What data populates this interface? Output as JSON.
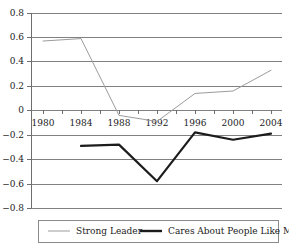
{
  "chart_data": {
    "type": "line",
    "title": "",
    "xlabel": "",
    "ylabel": "",
    "x": [
      1980,
      1984,
      1988,
      1992,
      1996,
      2000,
      2004
    ],
    "xlim": [
      1979,
      2005
    ],
    "ylim": [
      -0.8,
      0.8
    ],
    "grid": true,
    "legend_position": "bottom",
    "xticks": [
      "1980",
      "1984",
      "1988",
      "1992",
      "1996",
      "2000",
      "2004"
    ],
    "yticks": [
      "0.8",
      "0.6",
      "0.4",
      "0.2",
      "0",
      "−0.2",
      "−0.4",
      "−0.6",
      "−0.8"
    ],
    "ytick_values": [
      0.8,
      0.6,
      0.4,
      0.2,
      0,
      -0.2,
      -0.4,
      -0.6,
      -0.8
    ],
    "series": [
      {
        "name": "Strong Leader",
        "color": "#9b9b9b",
        "x": [
          1980,
          1984,
          1988,
          1992,
          1996,
          2000,
          2004
        ],
        "values": [
          0.57,
          0.59,
          -0.04,
          -0.09,
          0.14,
          0.16,
          0.33
        ]
      },
      {
        "name": "Cares About People Like Me",
        "color": "#1c1c1c",
        "x": [
          1984,
          1988,
          1992,
          1996,
          2000,
          2004
        ],
        "values": [
          -0.29,
          -0.28,
          -0.58,
          -0.18,
          -0.24,
          -0.19
        ]
      }
    ]
  },
  "legend": {
    "items": [
      {
        "label": "Strong Leader",
        "swatch": "thin-gray-line"
      },
      {
        "label": "Cares About People Like Me",
        "swatch": "thick-black-line"
      }
    ]
  },
  "axes": {
    "y_labels": [
      "0.8",
      "0.6",
      "0.4",
      "0.2",
      "0",
      "−0.2",
      "−0.4",
      "−0.6",
      "−0.8"
    ],
    "x_labels": [
      "1980",
      "1984",
      "1988",
      "1992",
      "1996",
      "2000",
      "2004"
    ]
  }
}
